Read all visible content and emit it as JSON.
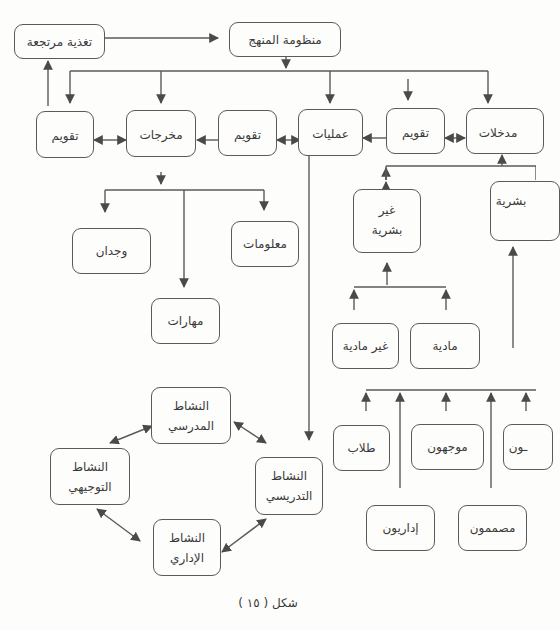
{
  "diagram": {
    "caption": "شكل ( ١٥ )",
    "nodes": {
      "curriculum_system": "منظومة المنهج",
      "feedback": "تغذية مرتجعة",
      "inputs": "مدخلات",
      "evaluation_1": "تقويم",
      "processes": "عمليات",
      "evaluation_2": "تقويم",
      "outputs": "مخرجات",
      "evaluation_3": "تقويم",
      "knowledge": "معلومات",
      "skills": "مهارات",
      "affect": "وجدان",
      "human": "بشرية",
      "non_human_line1": "غير",
      "non_human_line2": "بشرية",
      "material": "مادية",
      "non_material": "غير مادية",
      "students": "طلاب",
      "supervisors": "موجهون",
      "teachers_partial": "ـون",
      "administrators": "إداريون",
      "designers": "مصممون",
      "school_activity_line1": "النشاط",
      "school_activity_line2": "المدرسي",
      "guidance_activity_line1": "النشاط",
      "guidance_activity_line2": "التوجيهي",
      "teaching_activity_line1": "النشاط",
      "teaching_activity_line2": "التدريسي",
      "admin_activity_line1": "النشاط",
      "admin_activity_line2": "الإداري"
    },
    "edges": [
      {
        "from": "feedback",
        "to": "curriculum_system",
        "type": "arrow"
      },
      {
        "from": "curriculum_system",
        "to": [
          "evaluation_3",
          "outputs",
          "processes",
          "evaluation_1",
          "inputs"
        ],
        "type": "bus-down"
      },
      {
        "from": "evaluation_3",
        "to": "feedback",
        "type": "arrow"
      },
      {
        "from": "evaluation_3",
        "to": "outputs",
        "type": "bidirectional"
      },
      {
        "from": "evaluation_2",
        "to": "outputs",
        "type": "arrow"
      },
      {
        "from": "processes",
        "to": "evaluation_2",
        "type": "bidirectional"
      },
      {
        "from": "evaluation_1",
        "to": "processes",
        "type": "arrow"
      },
      {
        "from": "evaluation_1",
        "to": "inputs",
        "type": "bidirectional"
      },
      {
        "from": "outputs",
        "to": [
          "knowledge",
          "skills",
          "affect"
        ],
        "type": "bus-down"
      },
      {
        "from": [
          "human",
          "non_human"
        ],
        "to": "inputs",
        "type": "bus-up"
      },
      {
        "from": [
          "material",
          "non_material"
        ],
        "to": "non_human",
        "type": "bus-up"
      },
      {
        "from": [
          "students",
          "administrators",
          "supervisors",
          "designers",
          "teachers_partial"
        ],
        "to": "human",
        "type": "bus-up"
      },
      {
        "from": "processes",
        "to": "teaching_activity",
        "type": "arrow"
      },
      {
        "from": "school_activity",
        "to": "teaching_activity",
        "type": "bidirectional"
      },
      {
        "from": "school_activity",
        "to": "guidance_activity",
        "type": "bidirectional"
      },
      {
        "from": "guidance_activity",
        "to": "admin_activity",
        "type": "bidirectional"
      },
      {
        "from": "admin_activity",
        "to": "teaching_activity",
        "type": "bidirectional"
      }
    ],
    "colors": {
      "stroke": "#5a5a5a",
      "text": "#3a3a3a",
      "background": "#fdfdfb"
    }
  }
}
